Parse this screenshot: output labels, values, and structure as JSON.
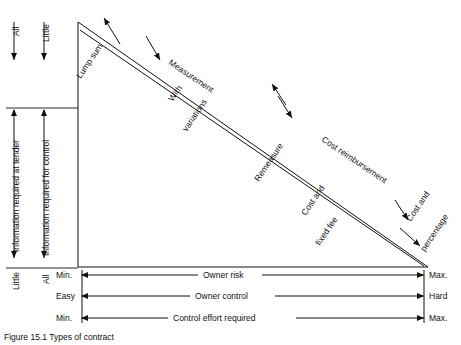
{
  "diagram": {
    "vertical_axis_labels": [
      {
        "key": "little_top",
        "text": "Little"
      },
      {
        "key": "all_top",
        "text": "All"
      },
      {
        "key": "info_tender",
        "text": "Information required at tender"
      },
      {
        "key": "info_control",
        "text": "Information required for control"
      },
      {
        "key": "little_bottom",
        "text": "Little"
      },
      {
        "key": "all_bottom",
        "text": "All"
      }
    ],
    "contract_labels": [
      {
        "key": "lump_sum",
        "text": "Lump sum"
      },
      {
        "key": "measurement",
        "text": "Measurement"
      },
      {
        "key": "with_variations",
        "text": "With variations"
      },
      {
        "key": "remeasure",
        "text": "Remeasure"
      },
      {
        "key": "cost_reimbursement",
        "text": "Cost reimbursement"
      },
      {
        "key": "cost_and_fixed_fee",
        "text": "Cost and\nfixed fee"
      },
      {
        "key": "cost_and_percentage",
        "text": "Cost and\npercentage"
      }
    ],
    "contract_label_text": {
      "lump_sum": "Lump sum",
      "measurement": "Measurement",
      "with_variations_1": "With",
      "with_variations_2": "variations",
      "remeasure": "Remeasure",
      "cost_reimbursement": "Cost reimbursement",
      "cost_fixed_fee_1": "Cost and",
      "cost_fixed_fee_2": "fixed fee",
      "cost_percentage_1": "Cost and",
      "cost_percentage_2": "percentage"
    },
    "scales": [
      {
        "key": "owner_risk",
        "label": "Owner risk",
        "left": "Min.",
        "right": "Max."
      },
      {
        "key": "owner_control",
        "label": "Owner control",
        "left": "Easy",
        "right": "Hard"
      },
      {
        "key": "control_effort",
        "label": "Control effort required",
        "left": "Min.",
        "right": "Max."
      }
    ],
    "caption": "Figure 15.1 Types of contract"
  }
}
